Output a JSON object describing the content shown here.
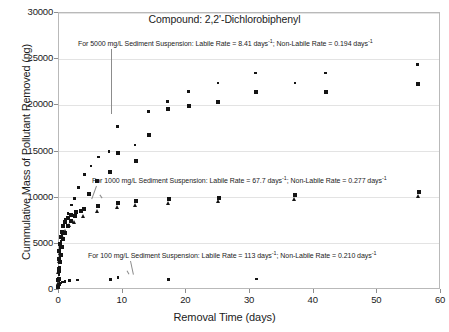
{
  "chart_data": {
    "type": "scatter",
    "title": "Compound: 2,2'-Dichlorobiphenyl",
    "xlabel": "Removal Time (days)",
    "ylabel": "Cummulative Mass of Pollutant Removed (ng)",
    "xlim": [
      0,
      60
    ],
    "ylim": [
      0,
      30000
    ],
    "xticks": [
      0,
      10,
      20,
      30,
      40,
      50,
      60
    ],
    "yticks": [
      0,
      5000,
      10000,
      15000,
      20000,
      25000,
      30000
    ],
    "xtick_labels": [
      "0",
      "10",
      "20",
      "30",
      "40",
      "50",
      "60"
    ],
    "ytick_labels": [
      "0",
      "5000",
      "10000",
      "15000",
      "20000",
      "25000",
      "30000"
    ],
    "grid": true,
    "legend": "none",
    "annotations": [
      {
        "id": "note-5000",
        "text": "For 5000 mg/L Sediment Suspension: Labile Rate = 8.41 days",
        "sup1": "-1",
        "text2": "; Non-Labile Rate = 0.194 days",
        "sup2": "-1",
        "series": "5000 mg/L"
      },
      {
        "id": "note-1000",
        "text": "For 1000 mg/L Sediment Suspension: Labile Rate = 67.7 days",
        "sup1": "-1",
        "text2": "; Non-Labile Rate = 0.277 days",
        "sup2": "-1",
        "series": "1000 mg/L"
      },
      {
        "id": "note-100",
        "text": "For 100 mg/L Sediment Suspension: Labile Rate = 113 days",
        "sup1": "-1",
        "text2": "; Non-Labile Rate = 0.210 days",
        "sup2": "-1",
        "series": "100 mg/L"
      }
    ],
    "series": [
      {
        "name": "5000 mg/L Sediment Suspension (open/small)",
        "marker": "dot",
        "color": "#141414",
        "points": [
          [
            0.05,
            300
          ],
          [
            0.1,
            900
          ],
          [
            0.15,
            1600
          ],
          [
            0.2,
            2400
          ],
          [
            0.25,
            3100
          ],
          [
            0.3,
            3800
          ],
          [
            0.4,
            4500
          ],
          [
            0.5,
            5200
          ],
          [
            0.6,
            5800
          ],
          [
            0.7,
            6300
          ],
          [
            0.9,
            6900
          ],
          [
            1.2,
            7500
          ],
          [
            1.6,
            8200
          ],
          [
            2.1,
            9100
          ],
          [
            2.6,
            9800
          ],
          [
            3.2,
            11000
          ],
          [
            4.2,
            12400
          ],
          [
            5.2,
            13300
          ],
          [
            6.4,
            14300
          ],
          [
            8.0,
            14900
          ],
          [
            9.3,
            17600
          ],
          [
            12.1,
            15600
          ],
          [
            14.2,
            19200
          ],
          [
            17.2,
            20300
          ],
          [
            20.5,
            21400
          ],
          [
            25.1,
            22300
          ],
          [
            31.0,
            23400
          ],
          [
            37.2,
            22300
          ],
          [
            42.0,
            23400
          ],
          [
            56.5,
            24300
          ]
        ]
      },
      {
        "name": "5000 mg/L Sediment Suspension (filled squares)",
        "marker": "square",
        "color": "#141414",
        "points": [
          [
            0.05,
            250
          ],
          [
            0.12,
            1100
          ],
          [
            0.2,
            2000
          ],
          [
            0.3,
            2900
          ],
          [
            0.45,
            3700
          ],
          [
            0.6,
            4600
          ],
          [
            0.8,
            5400
          ],
          [
            1.1,
            6100
          ],
          [
            1.5,
            6800
          ],
          [
            2.0,
            7400
          ],
          [
            2.7,
            7900
          ],
          [
            3.6,
            8500
          ],
          [
            4.8,
            10300
          ],
          [
            6.2,
            11700
          ],
          [
            8.1,
            12700
          ],
          [
            9.4,
            14700
          ],
          [
            12.3,
            13900
          ],
          [
            14.3,
            16700
          ],
          [
            17.3,
            19500
          ],
          [
            20.6,
            19800
          ],
          [
            25.2,
            20300
          ],
          [
            31.1,
            21300
          ],
          [
            42.1,
            21300
          ],
          [
            56.6,
            22200
          ]
        ]
      },
      {
        "name": "1000 mg/L Sediment Suspension",
        "marker": "square",
        "color": "#141414",
        "points": [
          [
            0.05,
            1000
          ],
          [
            0.1,
            2200
          ],
          [
            0.15,
            3300
          ],
          [
            0.2,
            4100
          ],
          [
            0.3,
            4900
          ],
          [
            0.4,
            5600
          ],
          [
            0.6,
            6200
          ],
          [
            0.8,
            6800
          ],
          [
            1.1,
            7300
          ],
          [
            1.5,
            7700
          ],
          [
            2.1,
            8000
          ],
          [
            2.9,
            8300
          ],
          [
            4.1,
            8700
          ],
          [
            6.3,
            9000
          ],
          [
            9.4,
            9300
          ],
          [
            12.3,
            9500
          ],
          [
            17.4,
            9700
          ],
          [
            25.3,
            9900
          ],
          [
            37.3,
            10200
          ],
          [
            56.7,
            10500
          ]
        ]
      },
      {
        "name": "1000 mg/L Sediment Suspension (triangles)",
        "marker": "triangle",
        "color": "#141414",
        "points": [
          [
            0.05,
            700
          ],
          [
            0.1,
            1800
          ],
          [
            0.2,
            3000
          ],
          [
            0.3,
            3900
          ],
          [
            0.5,
            4700
          ],
          [
            0.8,
            5500
          ],
          [
            1.2,
            6300
          ],
          [
            1.8,
            6900
          ],
          [
            2.6,
            7300
          ],
          [
            4.0,
            7900
          ],
          [
            6.2,
            8400
          ],
          [
            9.3,
            8900
          ],
          [
            12.2,
            9100
          ],
          [
            17.3,
            9300
          ],
          [
            25.2,
            9500
          ],
          [
            37.2,
            9800
          ],
          [
            56.6,
            10100
          ]
        ]
      },
      {
        "name": "100 mg/L Sediment Suspension",
        "marker": "dot",
        "color": "#141414",
        "points": [
          [
            0.05,
            120
          ],
          [
            0.1,
            300
          ],
          [
            0.2,
            480
          ],
          [
            0.4,
            640
          ],
          [
            0.7,
            760
          ],
          [
            1.1,
            840
          ],
          [
            1.8,
            900
          ],
          [
            3.1,
            960
          ],
          [
            8.2,
            1020
          ],
          [
            9.4,
            1250
          ],
          [
            17.4,
            1060
          ],
          [
            31.2,
            1080
          ]
        ]
      }
    ]
  }
}
